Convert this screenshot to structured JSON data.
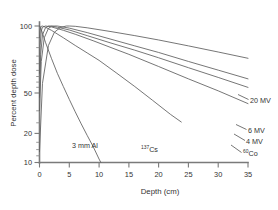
{
  "chart_data": {
    "type": "line",
    "title": "",
    "subtitle": "",
    "xlabel": "Depth (cm)",
    "ylabel": "Percent depth dose",
    "xlim": [
      0,
      35
    ],
    "ylim": [
      10,
      110
    ],
    "yscale": "log",
    "grid": false,
    "legend_position": "inline-right-labels",
    "x_ticks": [
      0,
      5,
      10,
      15,
      20,
      25,
      30,
      35
    ],
    "x_tick_labels": [
      "0",
      "5",
      "10",
      "15",
      "20",
      "25",
      "30",
      "35"
    ],
    "y_ticks": [
      10,
      20,
      50,
      100
    ],
    "y_tick_labels": [
      "10",
      "20",
      "50",
      "100"
    ],
    "y_minor_ticks": [
      30,
      40,
      60,
      70,
      80,
      90
    ],
    "series": [
      {
        "name": "3 mm Al",
        "label": "3 mm Al",
        "label_prefix": "3 mm Al",
        "label_sup": "",
        "label_suffix": "",
        "x": [
          0,
          0.05,
          0.15,
          0.3,
          0.6,
          1,
          2,
          3,
          4,
          5,
          6,
          7,
          8,
          9,
          10,
          10.3
        ],
        "y": [
          100,
          100,
          98,
          94,
          86,
          76,
          58,
          45,
          36,
          29,
          23.5,
          19.2,
          15.8,
          13.1,
          10.6,
          10
        ]
      },
      {
        "name": "137Cs",
        "label": "137Cs",
        "label_prefix": "",
        "label_sup": "137",
        "label_suffix": "Cs",
        "x": [
          0,
          0.1,
          0.2,
          0.3,
          0.5,
          1,
          2,
          4,
          6,
          8,
          10,
          13,
          16,
          19,
          22,
          23.8
        ],
        "y": [
          82,
          92,
          97,
          99.5,
          100,
          98,
          93,
          82,
          72,
          63.5,
          56,
          45,
          36,
          28.5,
          22.5,
          19.8
        ]
      },
      {
        "name": "60Co",
        "label": "60Co",
        "label_prefix": "",
        "label_sup": "60",
        "label_suffix": "Co",
        "x": [
          0,
          0.1,
          0.3,
          0.5,
          1,
          2,
          4,
          6,
          9,
          12,
          15,
          20,
          25,
          30,
          35
        ],
        "y": [
          45,
          72,
          92,
          98,
          100,
          98.5,
          93,
          87,
          78,
          69.5,
          62,
          50.5,
          41,
          33.5,
          27
        ]
      },
      {
        "name": "4 MV",
        "label": "4 MV",
        "label_prefix": "4 MV",
        "label_sup": "",
        "label_suffix": "",
        "x": [
          0,
          0.2,
          0.5,
          1,
          1.5,
          2,
          3,
          5,
          8,
          12,
          16,
          20,
          25,
          30,
          35
        ],
        "y": [
          30,
          62,
          86,
          97,
          100,
          100,
          98,
          93.5,
          85,
          75,
          66.5,
          58.5,
          49.5,
          42,
          35.5
        ]
      },
      {
        "name": "6 MV",
        "label": "6 MV",
        "label_prefix": "6 MV",
        "label_sup": "",
        "label_suffix": "",
        "x": [
          0,
          0.3,
          0.8,
          1.5,
          2,
          2.5,
          3,
          5,
          8,
          12,
          16,
          20,
          25,
          30,
          35
        ],
        "y": [
          24,
          55,
          82,
          96,
          99.5,
          100,
          100,
          96.5,
          89.5,
          80,
          71.5,
          64,
          55,
          47.5,
          41
        ]
      },
      {
        "name": "20 MV",
        "label": "20 MV",
        "label_prefix": "20 MV",
        "label_sup": "",
        "label_suffix": "",
        "x": [
          0,
          0.5,
          1.5,
          2.5,
          3.5,
          4.5,
          5,
          6,
          8,
          12,
          16,
          20,
          25,
          30,
          35
        ],
        "y": [
          12,
          38,
          72,
          90,
          97.5,
          100,
          100,
          99.5,
          97,
          91,
          85,
          79,
          71.5,
          64.5,
          58
        ]
      }
    ]
  }
}
